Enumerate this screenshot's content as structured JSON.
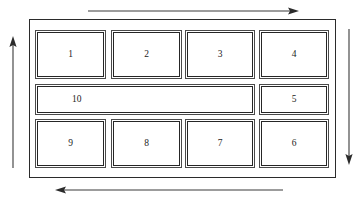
{
  "diagram": {
    "frame_name": "outer-boundary",
    "stroke_color": "#2b2b2b",
    "background_color": "#ffffff",
    "rows": [
      {
        "name": "top-row",
        "cells": [
          {
            "id": "cell-1",
            "label": "1",
            "width_class": "standard"
          },
          {
            "id": "cell-2",
            "label": "2",
            "width_class": "standard"
          },
          {
            "id": "cell-3",
            "label": "3",
            "width_class": "standard"
          },
          {
            "id": "cell-4",
            "label": "4",
            "width_class": "standard"
          }
        ]
      },
      {
        "name": "middle-row",
        "cells": [
          {
            "id": "cell-10",
            "label": "10",
            "width_class": "wide"
          },
          {
            "id": "cell-5",
            "label": "5",
            "width_class": "standard"
          }
        ]
      },
      {
        "name": "bottom-row",
        "cells": [
          {
            "id": "cell-9",
            "label": "9",
            "width_class": "standard"
          },
          {
            "id": "cell-8",
            "label": "8",
            "width_class": "standard"
          },
          {
            "id": "cell-7",
            "label": "7",
            "width_class": "standard"
          },
          {
            "id": "cell-6",
            "label": "6",
            "width_class": "standard"
          }
        ]
      }
    ],
    "arrows": [
      {
        "id": "arrow-top",
        "direction": "right",
        "position": "above-frame",
        "label": ""
      },
      {
        "id": "arrow-right",
        "direction": "down",
        "position": "right-of-frame",
        "label": ""
      },
      {
        "id": "arrow-bottom",
        "direction": "left",
        "position": "below-frame",
        "label": ""
      },
      {
        "id": "arrow-left",
        "direction": "up",
        "position": "left-of-frame",
        "label": ""
      }
    ],
    "circulation": "clockwise"
  }
}
